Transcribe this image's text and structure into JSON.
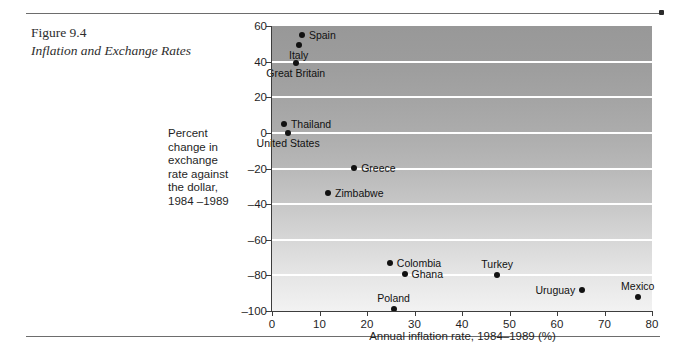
{
  "figure": {
    "number": "Figure 9.4",
    "title": "Inflation and Exchange Rates"
  },
  "y_axis_block_label": [
    "Percent",
    "change in",
    "exchange",
    "rate against",
    "the dollar,",
    "1984 –1989"
  ],
  "chart_data": {
    "type": "scatter",
    "title": "Inflation and Exchange Rates",
    "xlabel": "Annual inflation rate, 1984–1989 (%)",
    "ylabel": "Percent change in exchange rate against the dollar, 1984 –1989",
    "xlim": [
      0,
      80
    ],
    "ylim": [
      -100,
      60
    ],
    "xticks": [
      0,
      10,
      20,
      30,
      40,
      50,
      60,
      70,
      80
    ],
    "yticks": [
      60,
      40,
      20,
      0,
      -20,
      -40,
      -60,
      -80,
      -100
    ],
    "grid": "horizontal-white-gridlines",
    "legend": "none",
    "points": [
      {
        "label": "Spain",
        "x": 6.3,
        "y": 55.0,
        "label_pos": "right"
      },
      {
        "label": "Italy",
        "x": 5.6,
        "y": 49.5,
        "label_pos": "below"
      },
      {
        "label": "Great Britain",
        "x": 5.0,
        "y": 39.0,
        "label_pos": "below"
      },
      {
        "label": "Thailand",
        "x": 2.5,
        "y": 5.0,
        "label_pos": "right"
      },
      {
        "label": "United States",
        "x": 3.4,
        "y": 0.0,
        "label_pos": "below"
      },
      {
        "label": "Greece",
        "x": 17.3,
        "y": -19.5,
        "label_pos": "right"
      },
      {
        "label": "Zimbabwe",
        "x": 11.8,
        "y": -34.0,
        "label_pos": "right"
      },
      {
        "label": "Colombia",
        "x": 24.8,
        "y": -73.0,
        "label_pos": "right"
      },
      {
        "label": "Ghana",
        "x": 27.9,
        "y": -79.0,
        "label_pos": "right"
      },
      {
        "label": "Turkey",
        "x": 47.4,
        "y": -80.0,
        "label_pos": "above"
      },
      {
        "label": "Poland",
        "x": 25.6,
        "y": -99.0,
        "label_pos": "above"
      },
      {
        "label": "Uruguay",
        "x": 65.3,
        "y": -88.0,
        "label_pos": "left"
      },
      {
        "label": "Mexico",
        "x": 77.0,
        "y": -92.0,
        "label_pos": "above"
      }
    ]
  },
  "colors": {
    "plot_top": "#989898",
    "plot_bottom": "#f2f2f2",
    "gridline": "#ffffff",
    "marker": "#111111",
    "axis": "#3d3d3d",
    "rule": "#6d6d6d"
  }
}
